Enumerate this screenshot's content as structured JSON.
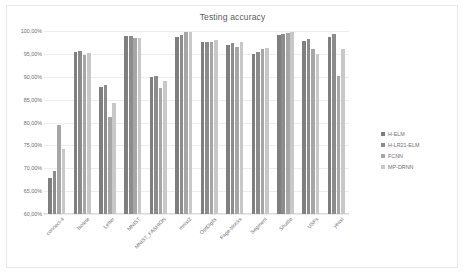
{
  "chart_data": {
    "type": "bar",
    "title": "Testing accuracy",
    "xlabel": "",
    "ylabel": "",
    "ylim": [
      60,
      100
    ],
    "ytick_labels": [
      "100,00%",
      "95,00%",
      "90,00%",
      "85,00%",
      "80,00%",
      "75,00%",
      "70,00%",
      "65,00%",
      "60,00%"
    ],
    "ytick_values": [
      100,
      95,
      90,
      85,
      80,
      75,
      70,
      65,
      60
    ],
    "grid": true,
    "legend_position": "right",
    "categories": [
      "connect-4",
      "Isolete",
      "Letter",
      "MNIST",
      "MNIST_FASHION",
      "mnist2",
      "OptDigits",
      "Page-blocks",
      "Segment",
      "Shuttle",
      "USPs",
      "yeast"
    ],
    "series": [
      {
        "name": "H-ELM",
        "color": "#7f7f7f",
        "values": [
          67.8,
          95.4,
          87.8,
          99.0,
          90.0,
          98.6,
          97.7,
          97.0,
          95.0,
          99.2,
          97.8,
          98.8
        ]
      },
      {
        "name": "H-LR21-ELM",
        "color": "#8c8c8c",
        "values": [
          69.3,
          95.7,
          88.2,
          98.9,
          90.2,
          99.2,
          97.7,
          97.3,
          95.5,
          99.3,
          98.2,
          99.4
        ]
      },
      {
        "name": "FCNN",
        "color": "#a6a6a6",
        "values": [
          79.5,
          94.8,
          81.1,
          98.4,
          87.6,
          99.8,
          97.6,
          96.4,
          96.0,
          99.6,
          96.0,
          90.2
        ]
      },
      {
        "name": "MP-DRNN",
        "color": "#c8c8c8",
        "values": [
          74.3,
          95.2,
          84.2,
          98.4,
          89.0,
          99.8,
          98.0,
          97.5,
          96.3,
          99.7,
          94.9,
          96.0
        ]
      }
    ]
  }
}
